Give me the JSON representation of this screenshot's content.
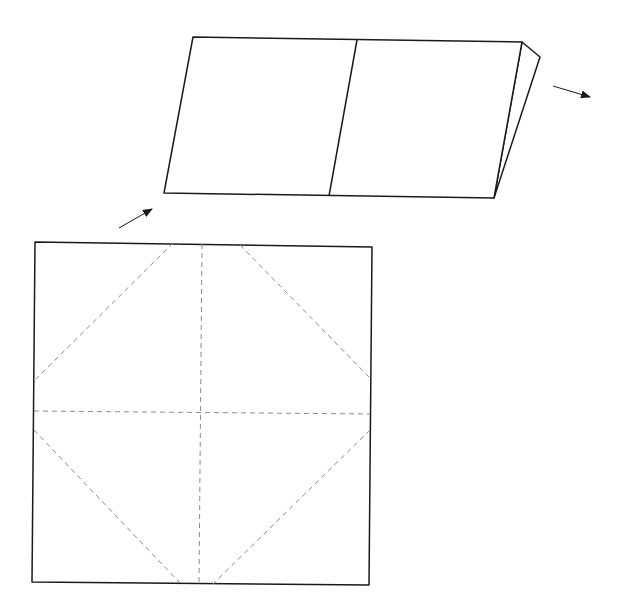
{
  "diagram": {
    "type": "origami-fold-instruction",
    "width": 625,
    "height": 612,
    "colors": {
      "background": "#ffffff",
      "solid_line": "#1a1a1a",
      "dashed_line": "#8a8a8a",
      "arrow": "#1a1a1a"
    },
    "folded_sheet": {
      "description": "Paper folded in half, shown in perspective as a parallelogram with a center crease and back flap",
      "front_outline": [
        [
          193,
          37
        ],
        [
          522,
          42
        ],
        [
          494,
          198
        ],
        [
          164,
          193
        ]
      ],
      "center_crease": [
        [
          357,
          40
        ],
        [
          329,
          196
        ]
      ],
      "back_flap": [
        [
          522,
          42
        ],
        [
          540,
          57
        ],
        [
          494,
          198
        ]
      ]
    },
    "square_sheet": {
      "description": "Flat square sheet with dashed crease pattern",
      "outline": [
        [
          35,
          242
        ],
        [
          372,
          247
        ],
        [
          369,
          585
        ],
        [
          32,
          582
        ]
      ],
      "creases": [
        {
          "name": "vertical-center",
          "from": [
            202,
            244
          ],
          "to": [
            199,
            583
          ]
        },
        {
          "name": "horizontal-center",
          "from": [
            34,
            411
          ],
          "to": [
            370,
            414
          ]
        },
        {
          "name": "top-left-diagonal",
          "from": [
            173,
            243
          ],
          "to": [
            36,
            379
          ]
        },
        {
          "name": "top-right-diagonal",
          "from": [
            240,
            245
          ],
          "to": [
            370,
            378
          ]
        },
        {
          "name": "bottom-left-diagonal",
          "from": [
            34,
            430
          ],
          "to": [
            180,
            583
          ]
        },
        {
          "name": "bottom-right-diagonal",
          "from": [
            370,
            430
          ],
          "to": [
            213,
            584
          ]
        }
      ]
    },
    "arrows": [
      {
        "name": "arrow-square-to-folded",
        "from": [
          119,
          228
        ],
        "to": [
          152,
          209
        ]
      },
      {
        "name": "arrow-next-step",
        "from": [
          553,
          86
        ],
        "to": [
          590,
          97
        ]
      }
    ]
  }
}
